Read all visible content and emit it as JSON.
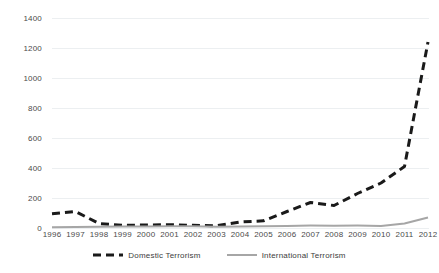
{
  "chart_data": {
    "type": "line",
    "title": "",
    "subtitle": "",
    "xlabel": "",
    "ylabel": "",
    "grid": true,
    "legend_position": "bottom",
    "ylim": [
      0,
      1400
    ],
    "y_ticks": [
      0,
      200,
      400,
      600,
      800,
      1000,
      1200,
      1400
    ],
    "categories": [
      "1996",
      "1997",
      "1998",
      "1999",
      "2000",
      "2001",
      "2002",
      "2003",
      "2004",
      "2005",
      "2006",
      "2007",
      "2008",
      "2009",
      "2010",
      "2011",
      "2012"
    ],
    "series": [
      {
        "name": "Domestic Terrorism",
        "style": "dashed",
        "color": "#1a1a1a",
        "values": [
          95,
          110,
          30,
          18,
          20,
          22,
          18,
          15,
          40,
          48,
          110,
          170,
          150,
          230,
          300,
          410,
          1240
        ]
      },
      {
        "name": "International Terrorism",
        "style": "solid",
        "color": "#a6a6a6",
        "values": [
          5,
          6,
          8,
          10,
          10,
          12,
          12,
          8,
          10,
          12,
          14,
          16,
          15,
          16,
          14,
          30,
          70
        ]
      }
    ]
  },
  "colors": {
    "domestic": "#1a1a1a",
    "international": "#a6a6a6",
    "gridline": "#eceff1",
    "axis_text": "#4a4a4a",
    "background": "#ffffff"
  }
}
